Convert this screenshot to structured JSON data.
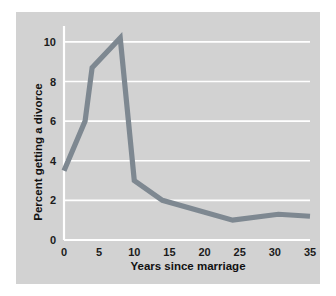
{
  "chart_data": {
    "type": "line",
    "title": "",
    "xlabel": "Years since marriage",
    "ylabel": "Percent getting a divorce",
    "xlim": [
      0,
      35
    ],
    "ylim": [
      0,
      10.6
    ],
    "xticks": [
      0,
      5,
      10,
      15,
      20,
      25,
      30,
      35
    ],
    "yticks": [
      0,
      2,
      4,
      6,
      8,
      10
    ],
    "xtick_labels": [
      "0",
      "5",
      "10",
      "15",
      "20",
      "25",
      "30",
      "35"
    ],
    "ytick_labels": [
      "0",
      "2",
      "4",
      "6",
      "8",
      "10"
    ],
    "grid": "horizontal",
    "legend": "none",
    "series": [
      {
        "name": "Percent getting a divorce",
        "color": "#7e8891",
        "x": [
          0,
          3,
          4,
          8,
          10,
          14,
          24,
          30.5,
          35
        ],
        "values": [
          3.5,
          6.0,
          8.7,
          10.2,
          3.0,
          2.0,
          1.0,
          1.3,
          1.2
        ]
      }
    ]
  },
  "figure": {
    "panel_color": "#d2d2d2",
    "grid_color": "#ffffff",
    "line_color": "#7e8891",
    "text_color": "#111111",
    "background_color": "#ffffff"
  }
}
